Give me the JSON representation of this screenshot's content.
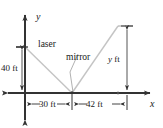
{
  "figure": {
    "axes": {
      "x_label": "x",
      "y_label": "y",
      "axis_color": "#333333",
      "origin": {
        "x": 25,
        "y": 93
      }
    },
    "rays": {
      "color": "#c2c2c2",
      "incident": {
        "name": "laser-ray",
        "from": {
          "x": 25,
          "y": 47
        },
        "to": {
          "x": 72,
          "y": 93
        }
      },
      "reflected": {
        "name": "reflected-ray",
        "from": {
          "x": 72,
          "y": 93
        },
        "to": {
          "x": 118,
          "y": 26
        }
      }
    },
    "labels": {
      "laser": "laser",
      "mirror": "mirror"
    },
    "dimensions": [
      {
        "name": "height-left",
        "label": "40 ft",
        "value": 40,
        "unit": "ft",
        "orientation": "vertical"
      },
      {
        "name": "distance-left",
        "label": "30 ft",
        "value": 30,
        "unit": "ft",
        "orientation": "horizontal"
      },
      {
        "name": "distance-right",
        "label": "42 ft",
        "value": 42,
        "unit": "ft",
        "orientation": "horizontal"
      },
      {
        "name": "height-right",
        "label": "y ft",
        "value": "y",
        "unit": "ft",
        "orientation": "vertical"
      }
    ],
    "dimension_labels": {
      "forty_ft": "40 ft",
      "thirty_ft": "30 ft",
      "fortytwo_ft": "42 ft",
      "y_var": "y",
      "y_unit": " ft"
    }
  }
}
